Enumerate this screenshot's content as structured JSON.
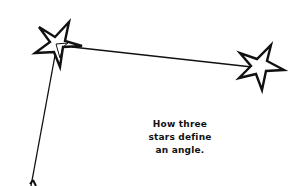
{
  "diagram": {
    "title": "",
    "caption_lines": [
      "How three",
      "stars define",
      "an angle."
    ],
    "colors": {
      "background": "#ffffff",
      "stroke": "#111111"
    },
    "stars": [
      {
        "name": "vertex-star",
        "cx": 57,
        "cy": 45
      },
      {
        "name": "right-star",
        "cx": 262,
        "cy": 67
      },
      {
        "name": "bottom-star",
        "cx": 33,
        "cy": 192
      }
    ],
    "rays": [
      {
        "name": "ray-to-right-star",
        "from": [
          72,
          47
        ],
        "to": [
          250,
          67
        ]
      },
      {
        "name": "ray-to-bottom-star",
        "from": [
          56,
          52
        ],
        "to": [
          32,
          186
        ]
      }
    ]
  }
}
